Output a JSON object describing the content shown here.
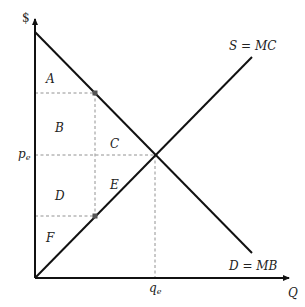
{
  "diagram": {
    "type": "supply-demand",
    "y_axis_label": "$",
    "x_axis_label": "Q",
    "supply_label": "S = MC",
    "demand_label": "D = MB",
    "price_label": {
      "base": "p",
      "sub": "e"
    },
    "quantity_label": {
      "base": "q",
      "sub": "e"
    },
    "regions": [
      "A",
      "B",
      "C",
      "D",
      "E",
      "F"
    ],
    "colors": {
      "line": "#111111",
      "dashed": "#666666",
      "dot": "#555555"
    }
  }
}
